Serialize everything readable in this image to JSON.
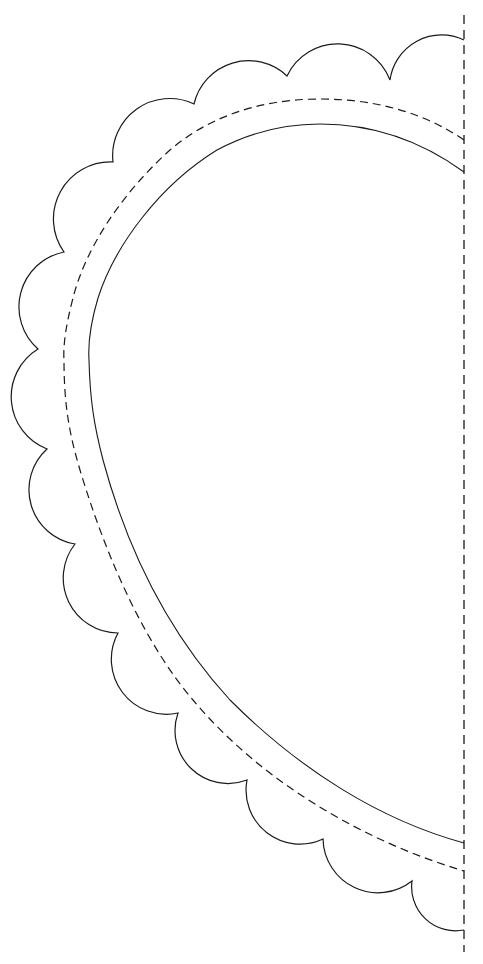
{
  "template": {
    "subject": "half heart scalloped template",
    "colors": {
      "background": "#ffffff",
      "stroke": "#1a1a1a"
    },
    "fold_line": {
      "x": 464,
      "y_start": 15,
      "y_end": 952,
      "style": "dashed"
    },
    "scallop_cusps": [
      [
        464,
        40
      ],
      [
        390,
        80
      ],
      [
        287,
        76
      ],
      [
        194,
        104
      ],
      [
        113,
        162
      ],
      [
        64,
        252
      ],
      [
        38,
        349
      ],
      [
        47,
        449
      ],
      [
        75,
        544
      ],
      [
        118,
        633
      ],
      [
        178,
        713
      ],
      [
        247,
        780
      ],
      [
        323,
        839
      ],
      [
        412,
        881
      ],
      [
        464,
        930
      ]
    ],
    "dashed_heart_line": {
      "style": "dashed",
      "points": [
        [
          464,
          140
        ],
        [
          320,
          99
        ],
        [
          170,
          150
        ],
        [
          73,
          298
        ],
        [
          64,
          350
        ],
        [
          73,
          450
        ],
        [
          193,
          700
        ],
        [
          464,
          871
        ]
      ]
    },
    "solid_heart_line": {
      "style": "solid",
      "points": [
        [
          464,
          172
        ],
        [
          320,
          124
        ],
        [
          217,
          150
        ],
        [
          98,
          298
        ],
        [
          89,
          355
        ],
        [
          100,
          450
        ],
        [
          230,
          700
        ],
        [
          464,
          843
        ]
      ]
    }
  }
}
